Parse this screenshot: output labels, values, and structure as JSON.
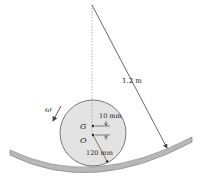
{
  "diagram": {
    "type": "mechanics-figure",
    "labels": {
      "track_radius": "1.2 m",
      "offset": "10 mm",
      "disk_radius": "120 mm",
      "center_of_mass": "G",
      "geometric_center": "O",
      "angular_velocity": "ω"
    },
    "colors": {
      "disk_fill": "#e3e3e3",
      "disk_stroke": "#6a6a6a",
      "track_fill": "#b8b8b8",
      "track_stroke": "#777777",
      "line": "#444444"
    }
  }
}
